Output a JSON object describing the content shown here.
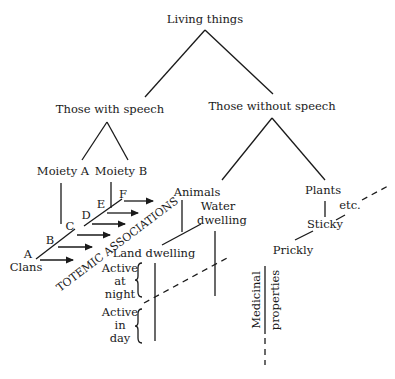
{
  "diagram": {
    "root": "Living things",
    "speech": {
      "label": "Those with speech",
      "moiety_a": "Moiety A",
      "moiety_b": "Moiety B",
      "clan_letters": [
        "A",
        "B",
        "C",
        "D",
        "E",
        "F"
      ],
      "clans_label": "Clans",
      "totemic_label": "TOTEMIC ASSOCIATIONS"
    },
    "no_speech": {
      "label": "Those without speech",
      "animals": {
        "label": "Animals",
        "water_1": "Water",
        "water_2": "dwelling",
        "land": "Land dwelling",
        "night_1": "Active",
        "night_2": "at",
        "night_3": "night",
        "day_1": "Active",
        "day_2": "in",
        "day_3": "day"
      },
      "plants": {
        "label": "Plants",
        "sticky": "Sticky",
        "etc": "etc.",
        "prickly": "Prickly",
        "medicinal_1": "Medicinal",
        "medicinal_2": "properties"
      }
    }
  }
}
